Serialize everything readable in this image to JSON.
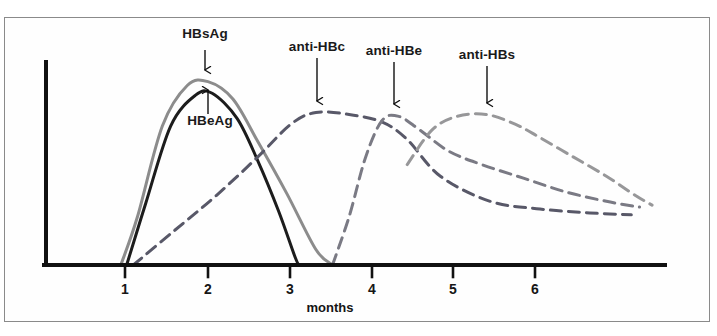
{
  "figure": {
    "border_color": "#8a8a8a",
    "background": "#ffffff"
  },
  "axes": {
    "x_axis_title": "months",
    "x_axis_title_x": 330,
    "x_axis_title_y": 300,
    "origin_x": 46,
    "origin_y": 265,
    "y_top": 62,
    "x_right": 665,
    "axis_color": "#111111",
    "tick_color": "#111111"
  },
  "chart_data": {
    "type": "line",
    "title": "",
    "subtitle": "",
    "xlabel": "months",
    "ylabel": "",
    "xlim": [
      0,
      7.5
    ],
    "ylim": [
      0,
      1.0
    ],
    "grid": false,
    "legend_position": "inline-annotations",
    "x_ticks": [
      {
        "label": "1",
        "value": 1,
        "px": 125
      },
      {
        "label": "2",
        "value": 2,
        "px": 208
      },
      {
        "label": "3",
        "value": 3,
        "px": 290
      },
      {
        "label": "4",
        "value": 4,
        "px": 372
      },
      {
        "label": "5",
        "value": 5,
        "px": 453
      },
      {
        "label": "6",
        "value": 6,
        "px": 535
      }
    ],
    "y_ticks": [],
    "series": [
      {
        "name": "HBsAg",
        "style": "solid",
        "color": "#8c8c8c",
        "width": 3.0,
        "x": [
          0.95,
          1.15,
          1.45,
          1.75,
          2.0,
          2.3,
          2.6,
          2.95,
          3.3,
          3.5
        ],
        "values": [
          0.0,
          0.25,
          0.72,
          0.93,
          0.95,
          0.86,
          0.64,
          0.37,
          0.08,
          0.0
        ],
        "peak_month": 2.0,
        "onset_month": 0.95,
        "end_month": 3.5
      },
      {
        "name": "HBeAg",
        "style": "solid",
        "color": "#1c1c1c",
        "width": 3.0,
        "x": [
          1.02,
          1.25,
          1.55,
          1.85,
          2.05,
          2.35,
          2.6,
          2.85,
          3.05,
          3.1
        ],
        "values": [
          0.0,
          0.32,
          0.72,
          0.88,
          0.89,
          0.76,
          0.54,
          0.28,
          0.04,
          0.0
        ],
        "peak_month": 2.05,
        "onset_month": 1.02,
        "end_month": 3.1
      },
      {
        "name": "anti-HBc",
        "style": "dashed",
        "color": "#585868",
        "width": 3.0,
        "x": [
          1.1,
          1.6,
          2.1,
          2.6,
          3.0,
          3.3,
          3.7,
          4.1,
          4.4,
          4.8,
          5.4,
          6.0,
          6.6,
          7.1
        ],
        "values": [
          0.0,
          0.18,
          0.36,
          0.56,
          0.73,
          0.79,
          0.78,
          0.74,
          0.65,
          0.46,
          0.33,
          0.29,
          0.27,
          0.26
        ],
        "peak_month": 3.35,
        "onset_month": 1.1,
        "end_month": 7.15
      },
      {
        "name": "anti-HBe",
        "style": "dashed",
        "color": "#7a7a84",
        "width": 3.0,
        "x": [
          3.5,
          3.7,
          3.9,
          4.1,
          4.3,
          4.55,
          4.9,
          5.3,
          5.8,
          6.3,
          6.8,
          7.2
        ],
        "values": [
          0.0,
          0.25,
          0.56,
          0.75,
          0.77,
          0.7,
          0.59,
          0.52,
          0.45,
          0.38,
          0.33,
          0.3
        ],
        "peak_month": 4.2,
        "onset_month": 3.5,
        "end_month": 7.2
      },
      {
        "name": "anti-HBs",
        "style": "dashed",
        "color": "#979799",
        "width": 3.0,
        "x": [
          4.4,
          4.7,
          5.0,
          5.35,
          5.7,
          6.0,
          6.4,
          6.8,
          7.15,
          7.35
        ],
        "values": [
          0.52,
          0.7,
          0.77,
          0.78,
          0.73,
          0.66,
          0.56,
          0.46,
          0.36,
          0.31
        ],
        "peak_month": 5.3,
        "onset_month": 4.35,
        "end_month": 7.35
      }
    ],
    "annotations": [
      {
        "text": "HBsAg",
        "label_x": 205,
        "label_y": 33,
        "arrow_from_x": 205,
        "arrow_from_y": 50,
        "arrow_to_x": 205,
        "arrow_to_y": 70,
        "arrow_direction": "down",
        "target_series": "HBsAg"
      },
      {
        "text": "HBeAg",
        "label_x": 210,
        "label_y": 120,
        "arrow_from_x": 208,
        "arrow_from_y": 114,
        "arrow_to_x": 208,
        "arrow_to_y": 90,
        "arrow_direction": "up",
        "target_series": "HBeAg"
      },
      {
        "text": "anti-HBc",
        "label_x": 317,
        "label_y": 46,
        "arrow_from_x": 317,
        "arrow_from_y": 58,
        "arrow_to_x": 317,
        "arrow_to_y": 101,
        "arrow_direction": "down",
        "target_series": "anti-HBc"
      },
      {
        "text": "anti-HBe",
        "label_x": 394,
        "label_y": 50,
        "arrow_from_x": 394,
        "arrow_from_y": 62,
        "arrow_to_x": 394,
        "arrow_to_y": 104,
        "arrow_direction": "down",
        "target_series": "anti-HBe"
      },
      {
        "text": "anti-HBs",
        "label_x": 487,
        "label_y": 54,
        "arrow_from_x": 487,
        "arrow_from_y": 66,
        "arrow_to_x": 487,
        "arrow_to_y": 103,
        "arrow_direction": "down",
        "target_series": "anti-HBs"
      }
    ]
  }
}
